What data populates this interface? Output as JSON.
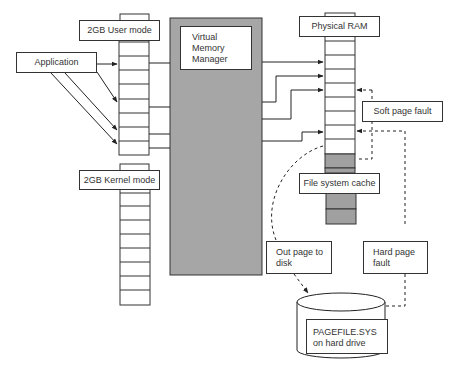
{
  "diagram": {
    "nodes": {
      "user_mode": {
        "label": "2GB User mode",
        "cells": 8
      },
      "kernel_mode": {
        "label": "2GB Kernel mode",
        "cells": 8
      },
      "application": {
        "label": "Application"
      },
      "vmm": {
        "label_lines": [
          "Virtual",
          "Memory",
          "Manager"
        ]
      },
      "physical_ram": {
        "label": "Physical RAM",
        "cells": 10,
        "cache_cells": 4
      },
      "file_system_cache": {
        "label": "File system cache"
      },
      "soft_page_fault": {
        "label": "Soft page fault"
      },
      "out_page": {
        "label_lines": [
          "Out page to",
          "disk"
        ]
      },
      "hard_page_fault": {
        "label_lines": [
          "Hard page",
          "fault"
        ]
      },
      "pagefile": {
        "label_lines": [
          "PAGEFILE.SYS",
          "on hard drive"
        ]
      }
    },
    "edges": [
      {
        "from": "Application",
        "to": "User mode page",
        "style": "solid",
        "count": 4
      },
      {
        "from": "Virtual Memory Manager",
        "to": "Physical RAM page",
        "style": "solid",
        "count": 4
      },
      {
        "from": "Physical RAM",
        "to": "PAGEFILE.SYS on hard drive",
        "label": "Out page to disk",
        "style": "dashed"
      },
      {
        "from": "File system cache",
        "to": "Physical RAM",
        "label": "Soft page fault",
        "style": "dashed"
      },
      {
        "from": "PAGEFILE.SYS on hard drive",
        "to": "Physical RAM",
        "label": "Hard page fault",
        "style": "dashed"
      }
    ],
    "colors": {
      "vmm_fill": "#a6a6a6",
      "cache_fill": "#a0a0a0",
      "line": "#333333"
    }
  }
}
